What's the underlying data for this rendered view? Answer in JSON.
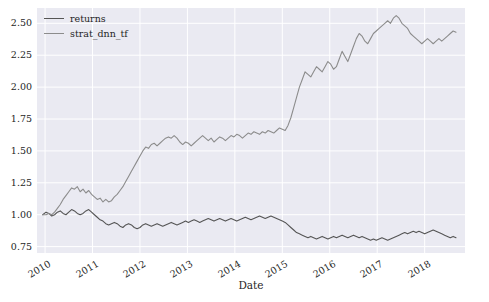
{
  "figure": {
    "background": "#ffffff",
    "axes_background": "#eaeaf2",
    "grid_color": "#ffffff",
    "text_color": "#262626"
  },
  "legend": {
    "entries": [
      {
        "label": "returns",
        "color": "#555555"
      },
      {
        "label": "strat_dnn_tf",
        "color": "#8c8c8c"
      }
    ]
  },
  "chart_data": {
    "type": "line",
    "title": "",
    "xlabel": "Date",
    "ylabel": "",
    "grid": true,
    "legend_position": "upper-left",
    "xlim": [
      2009.83,
      2018.85
    ],
    "ylim": [
      0.7,
      2.62
    ],
    "yticks": [
      0.75,
      1.0,
      1.25,
      1.5,
      1.75,
      2.0,
      2.25,
      2.5
    ],
    "ytick_labels": [
      "0.75",
      "1.00",
      "1.25",
      "1.50",
      "1.75",
      "2.00",
      "2.25",
      "2.50"
    ],
    "xticks": [
      2010,
      2011,
      2012,
      2013,
      2014,
      2015,
      2016,
      2017,
      2018
    ],
    "xtick_labels": [
      "2010",
      "2011",
      "2012",
      "2013",
      "2014",
      "2015",
      "2016",
      "2017",
      "2018"
    ],
    "series": [
      {
        "name": "returns",
        "color": "#555555",
        "linewidth": 1.1,
        "x": [
          2009.95,
          2010.02,
          2010.08,
          2010.14,
          2010.2,
          2010.26,
          2010.32,
          2010.38,
          2010.44,
          2010.5,
          2010.56,
          2010.62,
          2010.68,
          2010.74,
          2010.8,
          2010.86,
          2010.92,
          2010.98,
          2011.04,
          2011.1,
          2011.16,
          2011.22,
          2011.28,
          2011.34,
          2011.4,
          2011.46,
          2011.52,
          2011.58,
          2011.64,
          2011.7,
          2011.76,
          2011.82,
          2011.88,
          2011.94,
          2012.0,
          2012.06,
          2012.12,
          2012.18,
          2012.24,
          2012.3,
          2012.36,
          2012.42,
          2012.48,
          2012.54,
          2012.6,
          2012.66,
          2012.72,
          2012.78,
          2012.84,
          2012.9,
          2012.96,
          2013.02,
          2013.08,
          2013.14,
          2013.2,
          2013.26,
          2013.32,
          2013.38,
          2013.44,
          2013.5,
          2013.56,
          2013.62,
          2013.68,
          2013.74,
          2013.8,
          2013.86,
          2013.92,
          2013.98,
          2014.04,
          2014.1,
          2014.16,
          2014.22,
          2014.28,
          2014.34,
          2014.4,
          2014.46,
          2014.52,
          2014.58,
          2014.64,
          2014.7,
          2014.76,
          2014.82,
          2014.88,
          2014.94,
          2015.0,
          2015.06,
          2015.12,
          2015.18,
          2015.24,
          2015.3,
          2015.36,
          2015.42,
          2015.48,
          2015.54,
          2015.6,
          2015.66,
          2015.72,
          2015.78,
          2015.84,
          2015.9,
          2015.96,
          2016.02,
          2016.08,
          2016.14,
          2016.2,
          2016.26,
          2016.32,
          2016.38,
          2016.44,
          2016.5,
          2016.56,
          2016.62,
          2016.68,
          2016.74,
          2016.8,
          2016.86,
          2016.92,
          2016.98,
          2017.04,
          2017.1,
          2017.16,
          2017.22,
          2017.28,
          2017.34,
          2017.4,
          2017.46,
          2017.52,
          2017.58,
          2017.64,
          2017.7,
          2017.76,
          2017.82,
          2017.88,
          2017.94,
          2018.0,
          2018.06,
          2018.12,
          2018.18,
          2018.24,
          2018.3,
          2018.36,
          2018.42,
          2018.48,
          2018.54,
          2018.6,
          2018.66
        ],
        "y": [
          1.0,
          1.02,
          1.01,
          0.99,
          1.0,
          1.02,
          1.03,
          1.01,
          1.0,
          1.02,
          1.04,
          1.03,
          1.01,
          1.0,
          1.01,
          1.03,
          1.04,
          1.02,
          1.0,
          0.98,
          0.96,
          0.95,
          0.93,
          0.92,
          0.93,
          0.94,
          0.93,
          0.91,
          0.9,
          0.92,
          0.93,
          0.92,
          0.9,
          0.89,
          0.9,
          0.92,
          0.93,
          0.92,
          0.91,
          0.92,
          0.93,
          0.92,
          0.91,
          0.92,
          0.93,
          0.94,
          0.93,
          0.92,
          0.93,
          0.94,
          0.95,
          0.94,
          0.95,
          0.96,
          0.95,
          0.94,
          0.95,
          0.96,
          0.97,
          0.96,
          0.95,
          0.96,
          0.97,
          0.96,
          0.95,
          0.96,
          0.97,
          0.96,
          0.95,
          0.96,
          0.97,
          0.98,
          0.97,
          0.96,
          0.97,
          0.98,
          0.99,
          0.98,
          0.97,
          0.98,
          0.99,
          0.98,
          0.97,
          0.96,
          0.95,
          0.94,
          0.92,
          0.9,
          0.88,
          0.86,
          0.85,
          0.84,
          0.83,
          0.82,
          0.83,
          0.82,
          0.81,
          0.82,
          0.83,
          0.82,
          0.81,
          0.82,
          0.83,
          0.82,
          0.83,
          0.84,
          0.83,
          0.82,
          0.83,
          0.84,
          0.83,
          0.82,
          0.83,
          0.82,
          0.81,
          0.8,
          0.81,
          0.8,
          0.81,
          0.82,
          0.81,
          0.8,
          0.81,
          0.82,
          0.83,
          0.84,
          0.85,
          0.86,
          0.85,
          0.86,
          0.87,
          0.86,
          0.87,
          0.86,
          0.85,
          0.86,
          0.87,
          0.88,
          0.87,
          0.86,
          0.85,
          0.84,
          0.83,
          0.82,
          0.83,
          0.82
        ]
      },
      {
        "name": "strat_dnn_tf",
        "color": "#8c8c8c",
        "linewidth": 1.1,
        "x": [
          2009.95,
          2010.02,
          2010.08,
          2010.14,
          2010.2,
          2010.26,
          2010.32,
          2010.38,
          2010.44,
          2010.5,
          2010.56,
          2010.62,
          2010.68,
          2010.74,
          2010.8,
          2010.86,
          2010.92,
          2010.98,
          2011.04,
          2011.1,
          2011.16,
          2011.22,
          2011.28,
          2011.34,
          2011.4,
          2011.46,
          2011.52,
          2011.58,
          2011.64,
          2011.7,
          2011.76,
          2011.82,
          2011.88,
          2011.94,
          2012.0,
          2012.06,
          2012.12,
          2012.18,
          2012.24,
          2012.3,
          2012.36,
          2012.42,
          2012.48,
          2012.54,
          2012.6,
          2012.66,
          2012.72,
          2012.78,
          2012.84,
          2012.9,
          2012.96,
          2013.02,
          2013.08,
          2013.14,
          2013.2,
          2013.26,
          2013.32,
          2013.38,
          2013.44,
          2013.5,
          2013.56,
          2013.62,
          2013.68,
          2013.74,
          2013.8,
          2013.86,
          2013.92,
          2013.98,
          2014.04,
          2014.1,
          2014.16,
          2014.22,
          2014.28,
          2014.34,
          2014.4,
          2014.46,
          2014.52,
          2014.58,
          2014.64,
          2014.7,
          2014.76,
          2014.82,
          2014.88,
          2014.94,
          2015.0,
          2015.06,
          2015.12,
          2015.18,
          2015.24,
          2015.3,
          2015.36,
          2015.42,
          2015.48,
          2015.54,
          2015.6,
          2015.66,
          2015.72,
          2015.78,
          2015.84,
          2015.9,
          2015.96,
          2016.02,
          2016.08,
          2016.14,
          2016.2,
          2016.26,
          2016.32,
          2016.38,
          2016.44,
          2016.5,
          2016.56,
          2016.62,
          2016.68,
          2016.74,
          2016.8,
          2016.86,
          2016.92,
          2016.98,
          2017.04,
          2017.1,
          2017.16,
          2017.22,
          2017.28,
          2017.34,
          2017.4,
          2017.46,
          2017.52,
          2017.58,
          2017.64,
          2017.7,
          2017.76,
          2017.82,
          2017.88,
          2017.94,
          2018.0,
          2018.06,
          2018.12,
          2018.18,
          2018.24,
          2018.3,
          2018.36,
          2018.42,
          2018.48,
          2018.54,
          2018.6,
          2018.66
        ],
        "y": [
          1.0,
          1.0,
          1.01,
          1.0,
          1.02,
          1.05,
          1.08,
          1.12,
          1.15,
          1.18,
          1.21,
          1.2,
          1.22,
          1.18,
          1.2,
          1.17,
          1.19,
          1.16,
          1.14,
          1.12,
          1.13,
          1.1,
          1.12,
          1.1,
          1.11,
          1.14,
          1.16,
          1.19,
          1.22,
          1.26,
          1.3,
          1.34,
          1.38,
          1.42,
          1.46,
          1.5,
          1.53,
          1.52,
          1.55,
          1.56,
          1.54,
          1.56,
          1.58,
          1.6,
          1.61,
          1.6,
          1.62,
          1.6,
          1.57,
          1.55,
          1.57,
          1.56,
          1.54,
          1.56,
          1.58,
          1.6,
          1.62,
          1.6,
          1.58,
          1.6,
          1.57,
          1.59,
          1.61,
          1.6,
          1.58,
          1.6,
          1.62,
          1.61,
          1.63,
          1.62,
          1.6,
          1.62,
          1.64,
          1.63,
          1.65,
          1.64,
          1.63,
          1.65,
          1.64,
          1.66,
          1.65,
          1.64,
          1.66,
          1.68,
          1.67,
          1.66,
          1.7,
          1.76,
          1.84,
          1.92,
          2.0,
          2.06,
          2.12,
          2.1,
          2.08,
          2.12,
          2.16,
          2.14,
          2.12,
          2.16,
          2.2,
          2.18,
          2.14,
          2.16,
          2.22,
          2.28,
          2.24,
          2.2,
          2.26,
          2.32,
          2.38,
          2.42,
          2.4,
          2.36,
          2.34,
          2.38,
          2.42,
          2.44,
          2.46,
          2.48,
          2.5,
          2.52,
          2.5,
          2.54,
          2.56,
          2.54,
          2.5,
          2.48,
          2.46,
          2.42,
          2.4,
          2.38,
          2.36,
          2.34,
          2.36,
          2.38,
          2.36,
          2.34,
          2.36,
          2.38,
          2.36,
          2.38,
          2.4,
          2.42,
          2.44,
          2.43
        ]
      }
    ]
  }
}
